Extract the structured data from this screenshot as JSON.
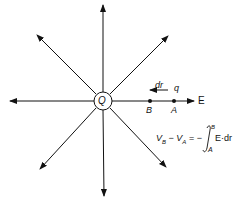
{
  "diagram": {
    "charge_label": "Q",
    "field_label": "E",
    "point_b_label": "B",
    "point_a_label": "A",
    "test_charge_label": "q",
    "displacement_label": "dr",
    "equation": {
      "lhs": "V",
      "lhs_sub_b": "B",
      "minus": "−",
      "rhs_v": "V",
      "lhs_sub_a": "A",
      "equals": "= −",
      "integral": "∫",
      "upper_limit": "B",
      "lower_limit": "A",
      "integrand": "E·dr"
    },
    "colors": {
      "line": "#111111",
      "background": "#ffffff"
    }
  }
}
